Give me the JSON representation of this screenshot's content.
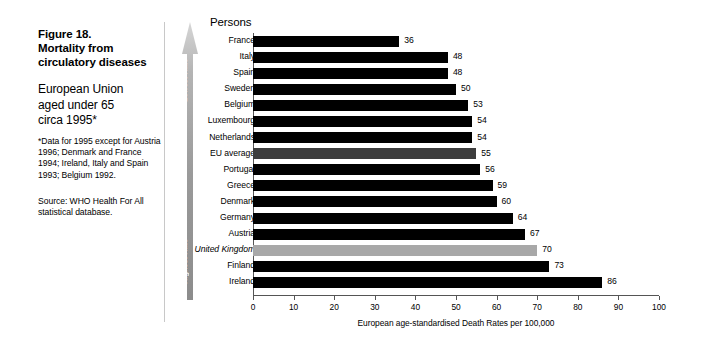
{
  "figure": {
    "title_lines": [
      "Figure 18.",
      "Mortality from",
      "circulatory diseases"
    ],
    "subtitle_lines": [
      "European Union",
      "aged under 65",
      "circa 1995*"
    ],
    "footnote": "*Data for 1995 except for Austria 1996; Denmark and France 1994; Ireland, Italy and Spain 1993; Belgium 1992.",
    "source": "Source: WHO Health For All statistical database."
  },
  "arrow": {
    "top_label": "Lowest Rate",
    "bottom_label": "Highest Rate"
  },
  "chart_header": "Persons",
  "colors": {
    "bar_default": "#000000",
    "bar_eu_average": "#3d3d3d",
    "bar_united_kingdom": "#a8a8a8"
  },
  "chart_data": {
    "type": "bar",
    "orientation": "horizontal",
    "title": "Figure 18. Mortality from circulatory diseases",
    "subtitle": "European Union aged under 65 circa 1995*",
    "xlabel": "European age-standardised Death Rates per 100,000",
    "ylabel": "Persons",
    "xlim": [
      0,
      100
    ],
    "xticks": [
      0,
      10,
      20,
      30,
      40,
      50,
      60,
      70,
      80,
      90,
      100
    ],
    "grid": false,
    "legend": null,
    "categories": [
      "France",
      "Italy",
      "Spain",
      "Sweden",
      "Belgium",
      "Luxembourg",
      "Netherlands",
      "EU average",
      "Portugal",
      "Greece",
      "Denmark",
      "Germany",
      "Austria",
      "United Kingdom",
      "Finland",
      "Ireland"
    ],
    "values": [
      36,
      48,
      48,
      50,
      53,
      54,
      54,
      55,
      56,
      59,
      60,
      64,
      67,
      70,
      73,
      86
    ],
    "highlight": {
      "EU average": "#3d3d3d",
      "United Kingdom": "#a8a8a8"
    },
    "italic_categories": [
      "United Kingdom"
    ]
  }
}
